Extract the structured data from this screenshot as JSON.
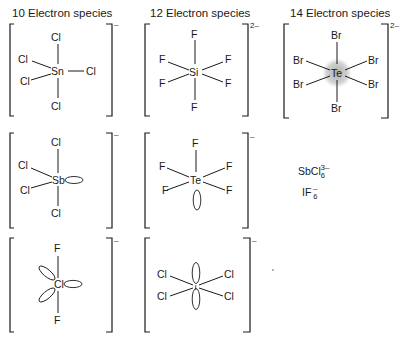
{
  "headers": {
    "col1": "10 Electron species",
    "col2": "12 Electron species",
    "col3": "14 Electron species"
  },
  "structures": {
    "sncl5": {
      "center": "Sn",
      "ligands": [
        "Cl",
        "Cl",
        "Cl",
        "Cl",
        "Cl"
      ],
      "charge": "–",
      "geometry": "trigonal bipyramidal"
    },
    "sif6": {
      "center": "Si",
      "ligands": [
        "F",
        "F",
        "F",
        "F",
        "F",
        "F"
      ],
      "charge": "2–",
      "geometry": "octahedral"
    },
    "tebr6": {
      "center": "Te",
      "ligands": [
        "Br",
        "Br",
        "Br",
        "Br",
        "Br",
        "Br"
      ],
      "charge": "2–",
      "geometry": "octahedral with stereochemically inactive lone pair"
    },
    "sbcl4": {
      "center": "Sb",
      "ligands": [
        "Cl",
        "Cl",
        "Cl",
        "Cl"
      ],
      "charge": "–",
      "geometry": "see-saw (one lone pair)"
    },
    "tef5": {
      "center": "Te",
      "ligands": [
        "F",
        "F",
        "F",
        "F",
        "F"
      ],
      "charge": "–",
      "geometry": "square pyramidal (one lone pair)"
    },
    "clf2": {
      "center": "Cl",
      "ligands": [
        "F",
        "F"
      ],
      "charge": "–",
      "geometry": "linear (three lone pairs)"
    },
    "icl4": {
      "center": "I",
      "ligands": [
        "Cl",
        "Cl",
        "Cl",
        "Cl"
      ],
      "charge": "–",
      "geometry": "square planar (two lone pairs)"
    }
  },
  "examples": {
    "sbcl6_formula": "SbCl",
    "sbcl6_sub": "6",
    "sbcl6_charge": "3–",
    "if6_formula": "IF",
    "if6_sub": "6",
    "if6_charge": "–"
  }
}
